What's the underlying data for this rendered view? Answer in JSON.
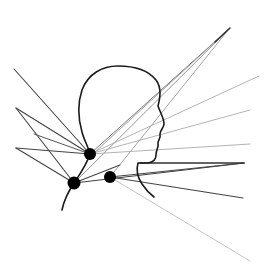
{
  "diagram": {
    "type": "line-drawing",
    "colors": {
      "background": "#ffffff",
      "contour": "#1a1a1a",
      "node": "#000000",
      "ray_dark": "#3a3a3a",
      "ray_mid": "#6a6a6a",
      "ray_light": "#b0b0b0"
    },
    "nodes": [
      {
        "id": "node-upper",
        "x": 90,
        "y": 154,
        "r": 6
      },
      {
        "id": "node-lower-left",
        "x": 74,
        "y": 183,
        "r": 6.5
      },
      {
        "id": "node-right",
        "x": 110,
        "y": 177,
        "r": 6
      }
    ],
    "anchors": {
      "top_right_apex": {
        "x": 229,
        "y": 29
      },
      "left_top": {
        "x": 14,
        "y": 69
      },
      "left_mid": {
        "x": 16,
        "y": 108
      },
      "left_low": {
        "x": 16,
        "y": 145
      }
    }
  }
}
